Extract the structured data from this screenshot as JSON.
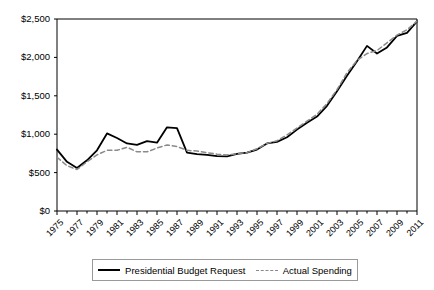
{
  "chart_data": {
    "type": "line",
    "title": "",
    "xlabel": "",
    "ylabel": "",
    "xlim": [
      1975,
      2011
    ],
    "ylim": [
      0,
      2500
    ],
    "grid": false,
    "legend_position": "bottom",
    "x": [
      1975,
      1976,
      1977,
      1978,
      1979,
      1980,
      1981,
      1982,
      1983,
      1984,
      1985,
      1986,
      1987,
      1988,
      1989,
      1990,
      1991,
      1992,
      1993,
      1994,
      1995,
      1996,
      1997,
      1998,
      1999,
      2000,
      2001,
      2002,
      2003,
      2004,
      2005,
      2006,
      2007,
      2008,
      2009,
      2010,
      2011
    ],
    "x_tick_labels": [
      "1975",
      "1977",
      "1979",
      "1981",
      "1983",
      "1985",
      "1987",
      "1989",
      "1991",
      "1993",
      "1995",
      "1997",
      "1999",
      "2001",
      "2003",
      "2005",
      "2007",
      "2009",
      "2011"
    ],
    "y_tick_labels": [
      "$0",
      "$500",
      "$1,000",
      "$1,500",
      "$2,000",
      "$2,500"
    ],
    "y_ticks": [
      0,
      500,
      1000,
      1500,
      2000,
      2500
    ],
    "series": [
      {
        "name": "Presidential Budget Request",
        "style": "solid",
        "color": "#000000",
        "values": [
          800,
          640,
          560,
          660,
          790,
          1010,
          950,
          880,
          860,
          910,
          890,
          1090,
          1080,
          760,
          740,
          730,
          715,
          710,
          745,
          760,
          800,
          880,
          900,
          960,
          1060,
          1150,
          1230,
          1370,
          1560,
          1760,
          1950,
          2150,
          2050,
          2130,
          2280,
          2320,
          2470
        ]
      },
      {
        "name": "Actual Spending",
        "style": "dashed",
        "color": "#8a8a8a",
        "values": [
          700,
          590,
          540,
          640,
          730,
          790,
          790,
          830,
          770,
          770,
          820,
          860,
          840,
          790,
          780,
          760,
          740,
          730,
          745,
          760,
          810,
          880,
          915,
          990,
          1080,
          1170,
          1260,
          1400,
          1580,
          1800,
          1960,
          2050,
          2090,
          2190,
          2290,
          2360,
          2470
        ]
      }
    ]
  },
  "legend": {
    "entries": [
      {
        "label": "Presidential Budget Request",
        "style": "solid"
      },
      {
        "label": "Actual Spending",
        "style": "dashed"
      }
    ]
  }
}
